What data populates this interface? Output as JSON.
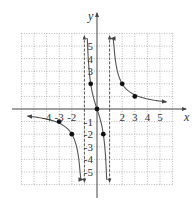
{
  "chart_data": {
    "type": "line",
    "title": "",
    "function": "f(x) = 3x/(x^2 - 1)",
    "xlabel": "x",
    "ylabel": "y",
    "xlim": [
      -6,
      6
    ],
    "ylim": [
      -6,
      6
    ],
    "grid": true,
    "x_tick_labels": [
      "-4",
      "-3",
      "-2",
      "2",
      "3",
      "4",
      "5"
    ],
    "x_ticks": [
      -4,
      -3,
      -2,
      2,
      3,
      4,
      5
    ],
    "y_tick_labels": [
      "5",
      "4",
      "3",
      "-1",
      "-2",
      "-3",
      "-4",
      "-5"
    ],
    "y_ticks": [
      5,
      4,
      3,
      -1,
      -2,
      -3,
      -4,
      -5
    ],
    "vertical_asymptotes": [
      -1,
      1
    ],
    "horizontal_asymptote": 0,
    "points": [
      {
        "x": -3,
        "y": -1
      },
      {
        "x": -2,
        "y": -2
      },
      {
        "x": -0.5,
        "y": 2
      },
      {
        "x": 0,
        "y": 0
      },
      {
        "x": 0.5,
        "y": -2
      },
      {
        "x": 2,
        "y": 2
      },
      {
        "x": 3,
        "y": 1
      }
    ],
    "series": [
      {
        "name": "left branch",
        "x_range": [
          -5.5,
          -1.12
        ]
      },
      {
        "name": "middle branch",
        "x_range": [
          -0.85,
          0.85
        ]
      },
      {
        "name": "right branch",
        "x_range": [
          1.12,
          5.5
        ]
      }
    ],
    "colors": {
      "curve": "#555555",
      "grid": "#999999",
      "axis": "#444444",
      "point": "#111111"
    }
  }
}
